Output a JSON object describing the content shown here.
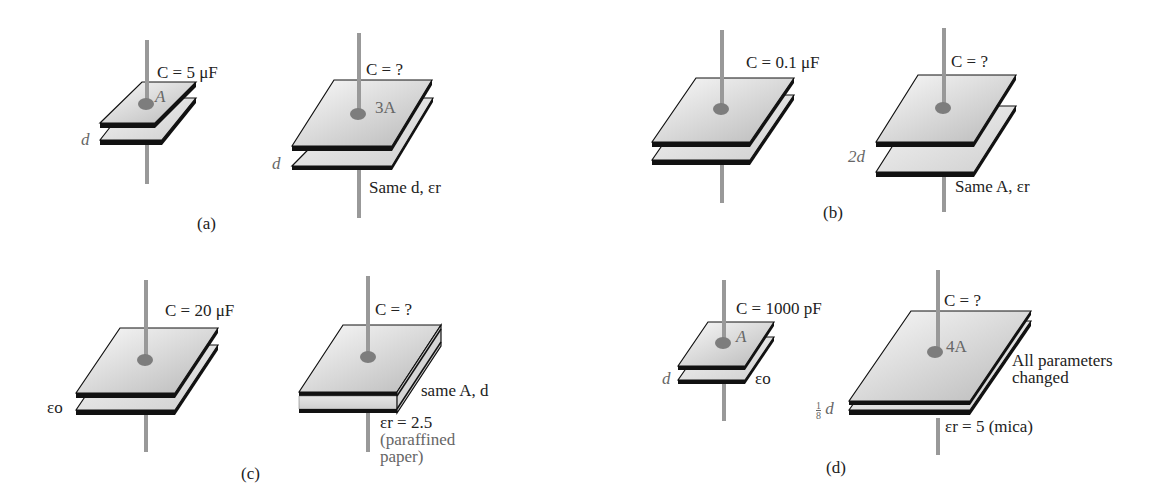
{
  "figure": {
    "panels": [
      {
        "id": "a",
        "caption": "(a)",
        "given": {
          "label": "C = 5 μF",
          "area": "A",
          "separation": "d"
        },
        "unknown": {
          "label": "C = ?",
          "area": "3A",
          "separation": "d",
          "note": "Same d, εr"
        }
      },
      {
        "id": "b",
        "caption": "(b)",
        "given": {
          "label": "C = 0.1 μF"
        },
        "unknown": {
          "label": "C = ?",
          "separation": "2d",
          "note": "Same A, εr"
        }
      },
      {
        "id": "c",
        "caption": "(c)",
        "given": {
          "label": "C = 20 μF",
          "dielectric": "εo"
        },
        "unknown": {
          "label": "C = ?",
          "note": "same A, d",
          "dielectric": "εr = 2.5",
          "material_line1": "(paraffined",
          "material_line2": "paper)"
        }
      },
      {
        "id": "d",
        "caption": "(d)",
        "given": {
          "label": "C = 1000 pF",
          "area": "A",
          "separation": "d",
          "dielectric": "εo"
        },
        "unknown": {
          "label": "C = ?",
          "area": "4A",
          "separation_num": "1",
          "separation_den": "8",
          "separation_var": "d",
          "note_line1": "All parameters",
          "note_line2": "changed",
          "dielectric": "εr = 5 (mica)"
        }
      }
    ]
  },
  "colors": {
    "plate_light": "#f2f2f2",
    "plate_dark": "#bdbdbd",
    "edge": "#111111",
    "lead": "#9a9a9a",
    "blob": "#7d7d7d",
    "dielectric": "#d9d9d9"
  }
}
